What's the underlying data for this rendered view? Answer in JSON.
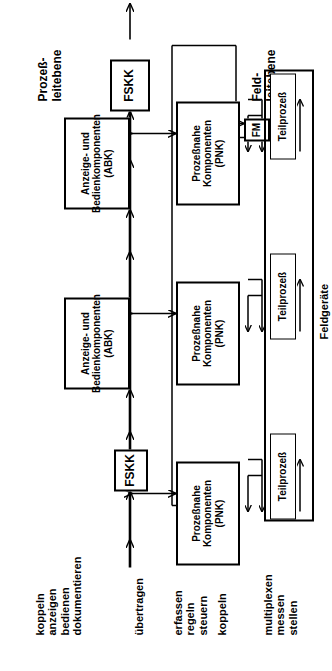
{
  "diagram": {
    "language": "de",
    "orientation": "rotated-90-ccw",
    "colors": {
      "stroke": "#000000",
      "background": "#ffffff",
      "box_fill": "#ffffff"
    }
  },
  "function_labels": {
    "group_abk": {
      "lines": [
        "koppeln",
        "anzeigen",
        "bedienen",
        "dokumentieren"
      ]
    },
    "group_bus": {
      "lines": [
        "übertragen"
      ]
    },
    "group_pnk": {
      "lines": [
        "erfassen",
        "regeln",
        "steuern"
      ]
    },
    "group_coupling": {
      "lines": [
        "koppeln"
      ]
    },
    "group_field": {
      "lines": [
        "multiplexen",
        "messen",
        "stellen"
      ]
    }
  },
  "level_labels": {
    "process_level": [
      "Prozeß-",
      "leitebene"
    ],
    "field_level": [
      "Feld-",
      "leitebene"
    ]
  },
  "nodes": {
    "fskk_top": {
      "label": "FSKK"
    },
    "fskk_bottom": {
      "label": "FSKK"
    },
    "abk_1": {
      "lines": [
        "Anzeige- und",
        "Bedienkomponenten",
        "(ABK)"
      ]
    },
    "abk_2": {
      "lines": [
        "Anzeige- und",
        "Bedienkomponenten",
        "(ABK)"
      ]
    },
    "pnk_1": {
      "lines": [
        "Prozeßnahe",
        "Komponenten",
        "(PNK)"
      ]
    },
    "pnk_2": {
      "lines": [
        "Prozeßnahe",
        "Komponenten",
        "(PNK)"
      ]
    },
    "pnk_3": {
      "lines": [
        "Prozeßnahe",
        "Komponenten",
        "(PNK)"
      ]
    },
    "teilprozess_1": {
      "label": "Teilprozeß"
    },
    "teilprozess_2": {
      "label": "Teilprozeß"
    },
    "teilprozess_3": {
      "label": "Teilprozeß"
    },
    "fm": {
      "label": "FM"
    },
    "feldgeraete": {
      "label": "Feldgeräte"
    }
  }
}
